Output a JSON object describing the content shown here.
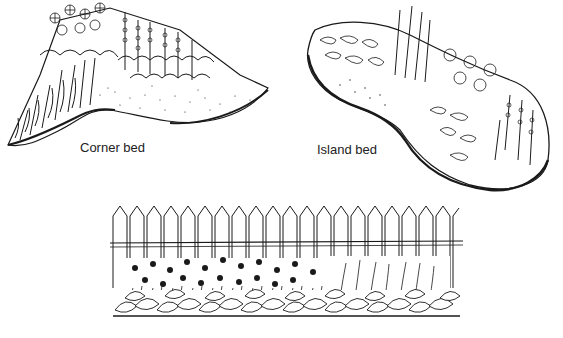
{
  "figure": {
    "panels": [
      {
        "id": "corner",
        "label": "Corner bed"
      },
      {
        "id": "island",
        "label": "Island bed"
      },
      {
        "id": "fence",
        "label": ""
      }
    ],
    "colors": {
      "ink": "#1a1a1a",
      "paper": "#ffffff"
    }
  }
}
